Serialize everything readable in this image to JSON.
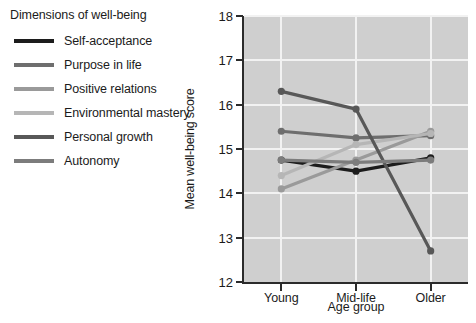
{
  "legend": {
    "title": "Dimensions of well-being",
    "items": [
      {
        "label": "Self-acceptance",
        "color": "#1c1c1c"
      },
      {
        "label": "Purpose in life",
        "color": "#6e6e6e"
      },
      {
        "label": "Positive relations",
        "color": "#9a9a9a"
      },
      {
        "label": "Environmental mastery",
        "color": "#b6b6b6"
      },
      {
        "label": "Personal growth",
        "color": "#585858"
      },
      {
        "label": "Autonomy",
        "color": "#7c7c7c"
      }
    ]
  },
  "chart_data": {
    "type": "line",
    "title": "",
    "xlabel": "Age group",
    "ylabel": "Mean well-being score",
    "categories": [
      "Young",
      "Mid-life",
      "Older"
    ],
    "ylim": [
      12,
      18
    ],
    "yticks": [
      12,
      13,
      14,
      15,
      16,
      17,
      18
    ],
    "ytick_labels": [
      "12",
      "13",
      "14",
      "15",
      "16",
      "17",
      "18"
    ],
    "grid": true,
    "legend_position": "left-outside",
    "plot_background": "#cfcfcf",
    "gridline_color": "#f2f2f2",
    "axis_color": "#2b2b2b",
    "series": [
      {
        "name": "Self-acceptance",
        "color": "#1c1c1c",
        "values": [
          14.75,
          14.5,
          14.8
        ]
      },
      {
        "name": "Purpose in life",
        "color": "#6e6e6e",
        "values": [
          15.4,
          15.25,
          15.3
        ]
      },
      {
        "name": "Positive relations",
        "color": "#9a9a9a",
        "values": [
          14.1,
          14.75,
          15.4
        ]
      },
      {
        "name": "Environmental mastery",
        "color": "#b6b6b6",
        "values": [
          14.4,
          15.1,
          15.35
        ]
      },
      {
        "name": "Personal growth",
        "color": "#585858",
        "values": [
          16.3,
          15.9,
          12.7
        ]
      },
      {
        "name": "Autonomy",
        "color": "#7c7c7c",
        "values": [
          14.75,
          14.7,
          14.75
        ]
      }
    ]
  }
}
